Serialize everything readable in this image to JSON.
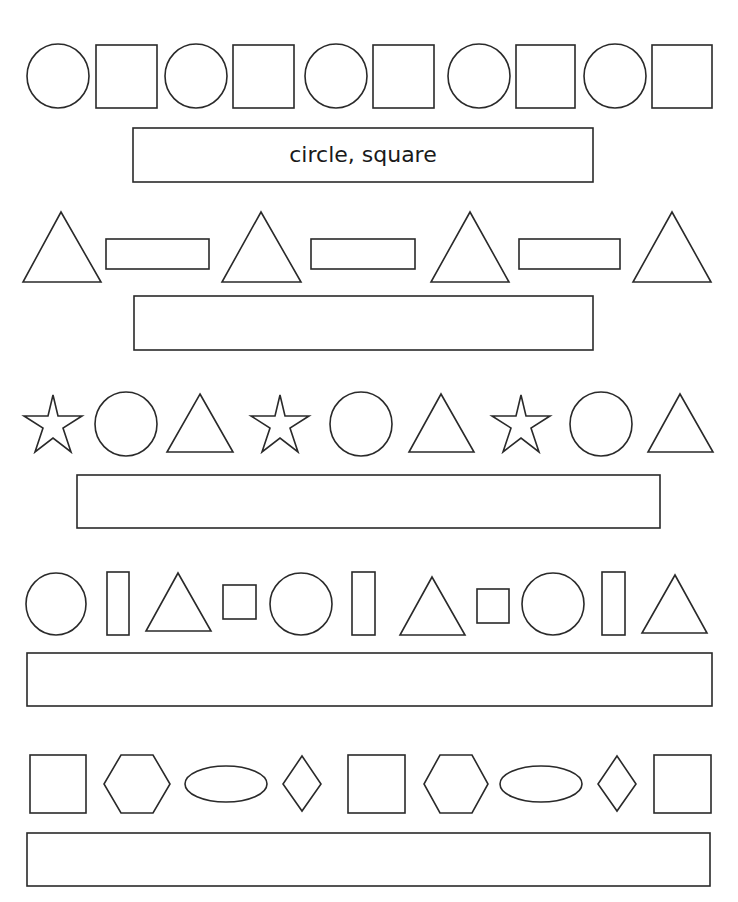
{
  "worksheet": {
    "stroke_color": "#2a2a2a",
    "rows": [
      {
        "pattern": [
          "circle",
          "square",
          "circle",
          "square",
          "circle",
          "square",
          "circle",
          "square",
          "circle",
          "square"
        ],
        "answer": "circle, square"
      },
      {
        "pattern": [
          "triangle",
          "rectangle",
          "triangle",
          "rectangle",
          "triangle",
          "rectangle",
          "triangle"
        ],
        "answer": ""
      },
      {
        "pattern": [
          "star",
          "circle",
          "triangle",
          "star",
          "circle",
          "triangle",
          "star",
          "circle",
          "triangle"
        ],
        "answer": ""
      },
      {
        "pattern": [
          "circle",
          "tall-rectangle",
          "triangle",
          "small-square",
          "circle",
          "tall-rectangle",
          "triangle",
          "small-square",
          "circle",
          "tall-rectangle",
          "triangle"
        ],
        "answer": ""
      },
      {
        "pattern": [
          "rectangle",
          "hexagon",
          "oval",
          "diamond",
          "rectangle",
          "hexagon",
          "oval",
          "diamond",
          "rectangle"
        ],
        "answer": ""
      }
    ]
  }
}
